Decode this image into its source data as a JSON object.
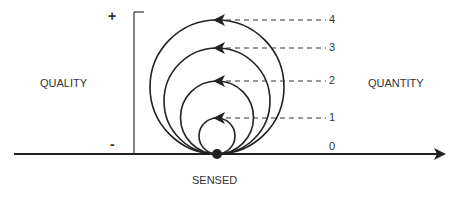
{
  "diagram": {
    "left_label": "QUALITY",
    "right_label": "QUANTITY",
    "bottom_label": "SENSED",
    "axis_plus": "+",
    "axis_minus": "-",
    "levels": [
      "0",
      "1",
      "2",
      "3",
      "4"
    ],
    "line_color": "#222222"
  }
}
